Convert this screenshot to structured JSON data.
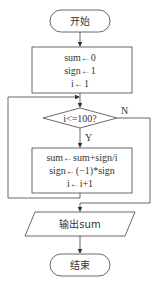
{
  "flowchart": {
    "start": {
      "label": "开始"
    },
    "init": {
      "lines": [
        "sum←0",
        "sign←1",
        "i←1"
      ]
    },
    "condition": {
      "label": "i<=100?",
      "yes_label": "Y",
      "no_label": "N"
    },
    "body": {
      "lines": [
        "sum←sum+sign/i",
        "sign←(−1)*sign",
        "i←i+1"
      ]
    },
    "output": {
      "label": "输出sum"
    },
    "end": {
      "label": "结束"
    }
  }
}
